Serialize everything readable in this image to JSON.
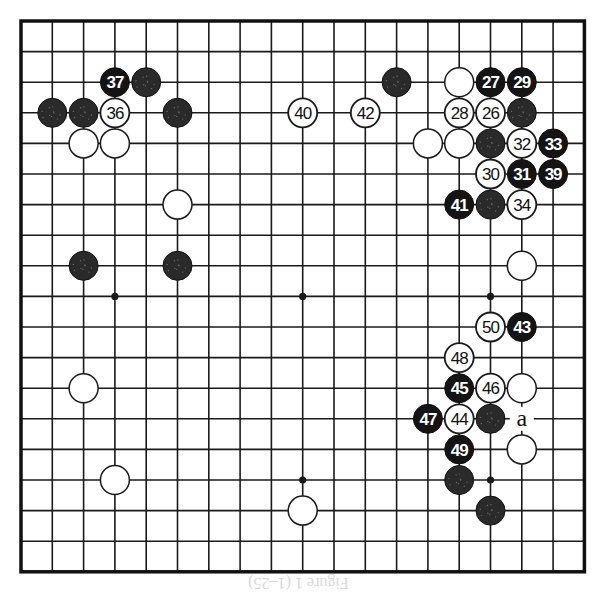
{
  "board": {
    "size": 19,
    "origin": {
      "x": 21,
      "y": 21
    },
    "spacing": {
      "x": 31.3,
      "y": 30.6
    },
    "line_color": "#1a1a1a",
    "border_color": "#111111",
    "star_points": [
      [
        3,
        3
      ],
      [
        3,
        9
      ],
      [
        3,
        15
      ],
      [
        9,
        3
      ],
      [
        9,
        9
      ],
      [
        9,
        15
      ],
      [
        15,
        3
      ],
      [
        15,
        9
      ],
      [
        15,
        15
      ]
    ]
  },
  "stones": [
    {
      "color": "black",
      "col": 3,
      "row": 2,
      "label": "37"
    },
    {
      "color": "black",
      "col": 4,
      "row": 2,
      "label": ""
    },
    {
      "color": "black",
      "col": 1,
      "row": 3,
      "label": ""
    },
    {
      "color": "black",
      "col": 2,
      "row": 3,
      "label": ""
    },
    {
      "color": "white",
      "col": 3,
      "row": 3,
      "label": "36"
    },
    {
      "color": "black",
      "col": 5,
      "row": 3,
      "label": ""
    },
    {
      "color": "white",
      "col": 2,
      "row": 4,
      "label": ""
    },
    {
      "color": "white",
      "col": 3,
      "row": 4,
      "label": ""
    },
    {
      "color": "white",
      "col": 5,
      "row": 6,
      "label": ""
    },
    {
      "color": "black",
      "col": 2,
      "row": 8,
      "label": ""
    },
    {
      "color": "black",
      "col": 5,
      "row": 8,
      "label": ""
    },
    {
      "color": "white",
      "col": 2,
      "row": 12,
      "label": ""
    },
    {
      "color": "white",
      "col": 3,
      "row": 15,
      "label": ""
    },
    {
      "color": "white",
      "col": 9,
      "row": 3,
      "label": "40"
    },
    {
      "color": "white",
      "col": 11,
      "row": 3,
      "label": "42"
    },
    {
      "color": "white",
      "col": 9,
      "row": 16,
      "label": ""
    },
    {
      "color": "black",
      "col": 12,
      "row": 2,
      "label": ""
    },
    {
      "color": "white",
      "col": 14,
      "row": 2,
      "label": ""
    },
    {
      "color": "black",
      "col": 15,
      "row": 2,
      "label": "27"
    },
    {
      "color": "black",
      "col": 16,
      "row": 2,
      "label": "29"
    },
    {
      "color": "white",
      "col": 14,
      "row": 3,
      "label": "28"
    },
    {
      "color": "white",
      "col": 15,
      "row": 3,
      "label": "26"
    },
    {
      "color": "black",
      "col": 16,
      "row": 3,
      "label": ""
    },
    {
      "color": "white",
      "col": 13,
      "row": 4,
      "label": ""
    },
    {
      "color": "white",
      "col": 14,
      "row": 4,
      "label": ""
    },
    {
      "color": "black",
      "col": 15,
      "row": 4,
      "label": ""
    },
    {
      "color": "white",
      "col": 16,
      "row": 4,
      "label": "32"
    },
    {
      "color": "black",
      "col": 17,
      "row": 4,
      "label": "33"
    },
    {
      "color": "white",
      "col": 15,
      "row": 5,
      "label": "30"
    },
    {
      "color": "black",
      "col": 16,
      "row": 5,
      "label": "31"
    },
    {
      "color": "black",
      "col": 17,
      "row": 5,
      "label": "39"
    },
    {
      "color": "black",
      "col": 14,
      "row": 6,
      "label": "41"
    },
    {
      "color": "black",
      "col": 15,
      "row": 6,
      "label": ""
    },
    {
      "color": "white",
      "col": 16,
      "row": 6,
      "label": "34"
    },
    {
      "color": "white",
      "col": 16,
      "row": 8,
      "label": ""
    },
    {
      "color": "white",
      "col": 15,
      "row": 10,
      "label": "50"
    },
    {
      "color": "black",
      "col": 16,
      "row": 10,
      "label": "43"
    },
    {
      "color": "white",
      "col": 14,
      "row": 11,
      "label": "48"
    },
    {
      "color": "black",
      "col": 14,
      "row": 12,
      "label": "45"
    },
    {
      "color": "white",
      "col": 15,
      "row": 12,
      "label": "46"
    },
    {
      "color": "white",
      "col": 16,
      "row": 12,
      "label": ""
    },
    {
      "color": "black",
      "col": 13,
      "row": 13,
      "label": "47"
    },
    {
      "color": "white",
      "col": 14,
      "row": 13,
      "label": "44"
    },
    {
      "color": "black",
      "col": 15,
      "row": 13,
      "label": ""
    },
    {
      "color": "black",
      "col": 14,
      "row": 14,
      "label": "49"
    },
    {
      "color": "white",
      "col": 16,
      "row": 14,
      "label": ""
    },
    {
      "color": "black",
      "col": 14,
      "row": 15,
      "label": ""
    },
    {
      "color": "black",
      "col": 15,
      "row": 16,
      "label": ""
    }
  ],
  "markers": [
    {
      "col": 16,
      "row": 13,
      "label": "a"
    }
  ],
  "caption": "Figure 1 (1–25)"
}
